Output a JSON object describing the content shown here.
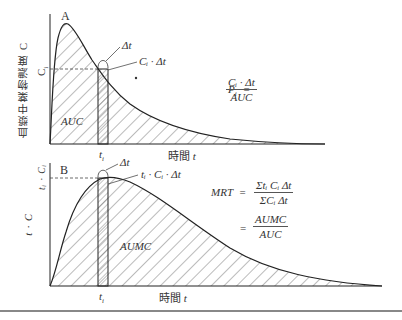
{
  "panel_a": {
    "letter": "A",
    "y_axis_label": "血漿中薬物濃度 C",
    "ci_tick": "C",
    "ci_sub": "i",
    "ti_tick": "t",
    "ti_sub": "i",
    "x_axis_label": "時間",
    "x_axis_var": "t",
    "delta_label": "Δt",
    "rect_label": "Cᵢ · Δt",
    "area_label": "AUC",
    "formula": {
      "lhs": "P",
      "lhs_sub": "i",
      "equals": "=",
      "numerator": "Cᵢ · Δt",
      "denominator": "AUC"
    }
  },
  "panel_b": {
    "letter": "B",
    "y_axis_label": "t · C",
    "peak_tick": "tᵢ · Cᵢ",
    "ti_tick": "t",
    "ti_sub": "i",
    "x_axis_label": "時間",
    "x_axis_var": "t",
    "delta_label": "Δt",
    "rect_label": "tᵢ · Cᵢ · Δt",
    "area_label": "AUMC",
    "formula": {
      "lhs": "MRT",
      "equals": "=",
      "numerator_1": "Σtᵢ Cᵢ Δt",
      "denominator_1": "ΣCᵢ Δt",
      "equals_2": "=",
      "numerator_2": "AUMC",
      "denominator_2": "AUC"
    }
  },
  "colors": {
    "line": "#222222",
    "hatch": "#555555",
    "separator": "#888888"
  }
}
